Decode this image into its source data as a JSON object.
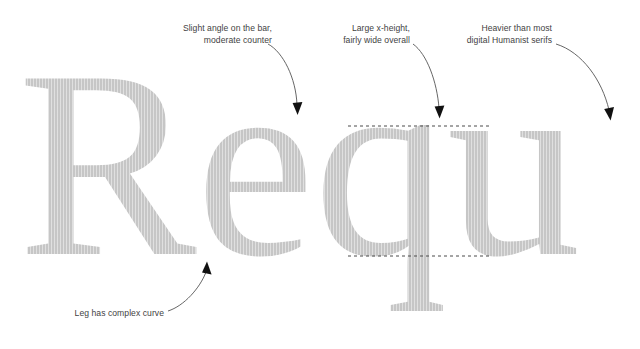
{
  "canvas": {
    "width": 640,
    "height": 349,
    "background": "#ffffff"
  },
  "specimen": {
    "name": "type-specimen",
    "glyphs": "Requ",
    "color": "#c6c6c6",
    "description": "Large serif letterforms R e q u shown in light grey with vertical scan striping"
  },
  "guides": {
    "x_height_line": {
      "label": "x-height",
      "style": "dashed",
      "color": "#4a4a4a",
      "y": 126
    },
    "baseline_line": {
      "label": "baseline",
      "style": "dashed",
      "color": "#4a4a4a",
      "y": 256
    }
  },
  "annotations": [
    {
      "id": "bar-angle",
      "lines": [
        "Slight angle on the bar,",
        "moderate counter"
      ],
      "align": "right",
      "target": "e-crossbar"
    },
    {
      "id": "x-height",
      "lines": [
        "Large x-height,",
        "fairly wide overall"
      ],
      "align": "right",
      "target": "q-bowl-top"
    },
    {
      "id": "weight",
      "lines": [
        "Heavier than most",
        "digital Humanist serifs"
      ],
      "align": "right",
      "target": "u-stem-top"
    },
    {
      "id": "leg-curve",
      "lines": [
        "Leg has complex curve"
      ],
      "align": "right",
      "target": "R-leg"
    }
  ],
  "arrows": [
    {
      "id": "arrow-bar-angle",
      "from": [
        268,
        44
      ],
      "to": [
        298,
        113
      ],
      "head": "down"
    },
    {
      "id": "arrow-x-height",
      "from": [
        413,
        44
      ],
      "to": [
        440,
        117
      ],
      "head": "down"
    },
    {
      "id": "arrow-weight",
      "from": [
        556,
        44
      ],
      "to": [
        610,
        118
      ],
      "head": "down"
    },
    {
      "id": "arrow-leg-curve",
      "from": [
        170,
        311
      ],
      "to": [
        207,
        261
      ],
      "head": "up"
    }
  ]
}
